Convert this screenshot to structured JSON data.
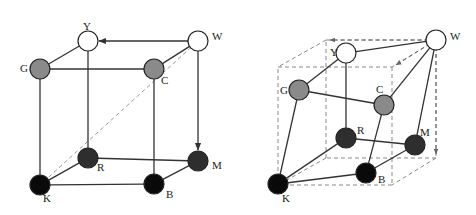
{
  "figure": {
    "colors": {
      "white_node": "#ffffff",
      "gray_node": "#8a8a8a",
      "dark_node": "#2e2e2e",
      "black_node": "#0a0a0a",
      "edge": "#333333",
      "dashed": "#888888"
    },
    "left_cube": {
      "nodes": [
        {
          "id": "Y",
          "label": "Y",
          "x": 88,
          "y": 41,
          "fill": "white",
          "lx": 83,
          "ly": 30
        },
        {
          "id": "W",
          "label": "W",
          "x": 198,
          "y": 41,
          "fill": "white",
          "lx": 212,
          "ly": 40
        },
        {
          "id": "G",
          "label": "G",
          "x": 40,
          "y": 69,
          "fill": "gray",
          "lx": 20,
          "ly": 72
        },
        {
          "id": "C",
          "label": "C",
          "x": 154,
          "y": 69,
          "fill": "gray",
          "lx": 161,
          "ly": 84
        },
        {
          "id": "R",
          "label": "R",
          "x": 88,
          "y": 158,
          "fill": "dark",
          "lx": 97,
          "ly": 171
        },
        {
          "id": "M",
          "label": "M",
          "x": 198,
          "y": 161,
          "fill": "dark",
          "lx": 212,
          "ly": 169
        },
        {
          "id": "K",
          "label": "K",
          "x": 40,
          "y": 185,
          "fill": "black",
          "lx": 43,
          "ly": 202
        },
        {
          "id": "B",
          "label": "B",
          "x": 154,
          "y": 184,
          "fill": "black",
          "lx": 166,
          "ly": 198
        }
      ],
      "edges": [
        [
          "Y",
          "G"
        ],
        [
          "G",
          "C"
        ],
        [
          "C",
          "W"
        ],
        [
          "Y",
          "R"
        ],
        [
          "G",
          "K"
        ],
        [
          "C",
          "B"
        ],
        [
          "R",
          "M"
        ],
        [
          "R",
          "K"
        ],
        [
          "K",
          "B"
        ],
        [
          "B",
          "M"
        ]
      ],
      "arrows": [
        [
          "W",
          "Y"
        ],
        [
          "W",
          "M"
        ]
      ],
      "dashed": [
        [
          "W",
          "K"
        ]
      ]
    },
    "right_cube": {
      "nodes": [
        {
          "id": "Y",
          "label": "Y",
          "x": 346,
          "y": 53,
          "fill": "white",
          "lx": 330,
          "ly": 56
        },
        {
          "id": "W",
          "label": "W",
          "x": 436,
          "y": 40,
          "fill": "white",
          "lx": 450,
          "ly": 40
        },
        {
          "id": "G",
          "label": "G",
          "x": 299,
          "y": 90,
          "fill": "gray",
          "lx": 280,
          "ly": 94
        },
        {
          "id": "C",
          "label": "C",
          "x": 384,
          "y": 105,
          "fill": "gray",
          "lx": 376,
          "ly": 93
        },
        {
          "id": "R",
          "label": "R",
          "x": 346,
          "y": 138,
          "fill": "dark",
          "lx": 357,
          "ly": 134
        },
        {
          "id": "M",
          "label": "M",
          "x": 415,
          "y": 145,
          "fill": "dark",
          "lx": 420,
          "ly": 136
        },
        {
          "id": "K",
          "label": "K",
          "x": 278,
          "y": 184,
          "fill": "black",
          "lx": 282,
          "ly": 202
        },
        {
          "id": "B",
          "label": "B",
          "x": 366,
          "y": 173,
          "fill": "black",
          "lx": 378,
          "ly": 183
        }
      ],
      "edges": [
        [
          "Y",
          "W"
        ],
        [
          "Y",
          "G"
        ],
        [
          "G",
          "C"
        ],
        [
          "C",
          "W"
        ],
        [
          "W",
          "M"
        ],
        [
          "Y",
          "R"
        ],
        [
          "G",
          "K"
        ],
        [
          "C",
          "B"
        ],
        [
          "R",
          "M"
        ],
        [
          "R",
          "K"
        ],
        [
          "K",
          "B"
        ],
        [
          "B",
          "M"
        ]
      ],
      "dashed_box": {
        "back_top_left": [
          326,
          40
        ],
        "back_top_right": [
          436,
          40
        ],
        "back_bottom_left": [
          326,
          158
        ],
        "back_bottom_right": [
          436,
          158
        ],
        "front_top_left": [
          278,
          67
        ],
        "front_top_right": [
          392,
          67
        ],
        "front_bottom_left": [
          278,
          185
        ],
        "front_bottom_right": [
          392,
          185
        ]
      },
      "dashed_arrows": [
        {
          "from": [
            436,
            40
          ],
          "to": [
            330,
            40
          ]
        },
        {
          "from": [
            436,
            40
          ],
          "to": [
            396,
            65
          ]
        },
        {
          "from": [
            436,
            40
          ],
          "to": [
            436,
            154
          ]
        }
      ]
    }
  }
}
